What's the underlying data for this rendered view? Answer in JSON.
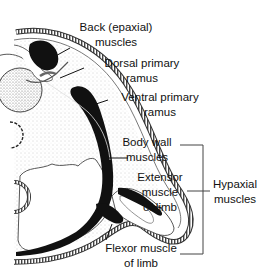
{
  "diagram": {
    "type": "anatomical cross-section",
    "labels": {
      "back_muscles": [
        "Back (epaxial)",
        "muscles"
      ],
      "dorsal_ramus": [
        "Dorsal primary",
        "ramus"
      ],
      "ventral_ramus": [
        "Ventral primary",
        "ramus"
      ],
      "body_wall": [
        "Body wall",
        "muscles"
      ],
      "extensor": [
        "Extensor",
        "muscle",
        "of limb"
      ],
      "hypaxial": [
        "Hypaxial",
        "muscles"
      ],
      "flexor": [
        "Flexor muscle",
        "of limb"
      ]
    },
    "colors": {
      "muscle": "#111111",
      "outline": "#333333",
      "stipple": "#bbbbbb",
      "background": "#ffffff"
    }
  }
}
